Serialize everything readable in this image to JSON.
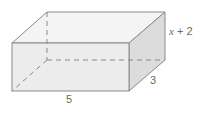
{
  "diagram": {
    "type": "rectangular-prism",
    "labels": {
      "length": "5",
      "depth": "3",
      "height_var": "x",
      "height_rest": " + 2"
    },
    "colors": {
      "edge": "#8a8a8a",
      "front_face": "#ececec",
      "top_face": "#f4f4f4",
      "side_face": "#dcdcdc",
      "label": "#6b6b6b"
    }
  }
}
